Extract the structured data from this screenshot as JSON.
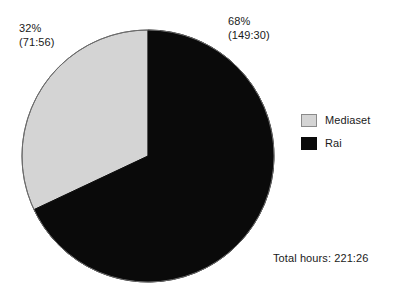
{
  "chart_data": {
    "type": "pie",
    "title": "",
    "subtitle": "",
    "xlabel": "",
    "ylabel": "",
    "grid": false,
    "legend_position": "right",
    "start_angle_deg": 0,
    "direction": "clockwise",
    "total_label": "Total hours: 221:26",
    "total_value": "221:26",
    "categories": [
      "Rai",
      "Mediaset"
    ],
    "values": [
      68,
      32
    ],
    "slices": [
      {
        "name": "Rai",
        "percent": 68,
        "percent_label": "68%",
        "value_label": "(149:30)",
        "hours": "149:30",
        "color": "#0a0a0a",
        "start_deg": 0,
        "end_deg": 244.8
      },
      {
        "name": "Mediaset",
        "percent": 32,
        "percent_label": "32%",
        "value_label": "(71:56)",
        "hours": "71:56",
        "color": "#d4d4d4",
        "start_deg": 244.8,
        "end_deg": 360
      }
    ],
    "annotations": [
      {
        "text": "32%",
        "sub": "(71:56)",
        "position": "top-left"
      },
      {
        "text": "68%",
        "sub": "(149:30)",
        "position": "top-right"
      },
      {
        "text": "Total hours: 221:26",
        "position": "bottom-right"
      }
    ]
  },
  "callouts": {
    "left": {
      "percent": "32%",
      "absolute": "(71:56)"
    },
    "right": {
      "percent": "68%",
      "absolute": "(149:30)"
    }
  },
  "legend": {
    "items": [
      {
        "label": "Mediaset",
        "color": "#d4d4d4"
      },
      {
        "label": "Rai",
        "color": "#0a0a0a"
      }
    ]
  },
  "footer": {
    "total": "Total hours: 221:26"
  },
  "colors": {
    "mediaset": "#d4d4d4",
    "rai": "#0a0a0a",
    "outline": "#6b6b6b",
    "background": "#ffffff",
    "text": "#1a1a1a"
  }
}
